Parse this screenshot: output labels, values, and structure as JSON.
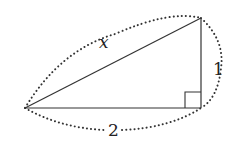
{
  "diagram": {
    "type": "right-triangle",
    "labels": {
      "hypotenuse": "x",
      "vertical_leg": "1",
      "horizontal_leg": "2"
    },
    "colors": {
      "stroke": "#333333",
      "dots": "#333333",
      "background": "#ffffff"
    }
  }
}
